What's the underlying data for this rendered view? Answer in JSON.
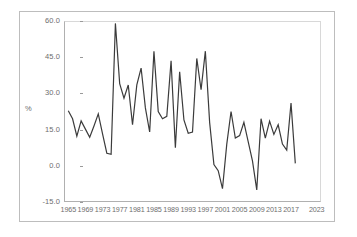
{
  "chart_data": {
    "type": "line",
    "title": "",
    "xlabel": "",
    "ylabel": "%",
    "xlim": [
      1964,
      2024
    ],
    "ylim": [
      -15.0,
      60.0
    ],
    "grid": false,
    "legend": "none",
    "line_color": "#3b3b3b",
    "frame_color": "#bdbdbd",
    "axis_color": "#b0b0b0",
    "tick_text_color": "#6e6e6e",
    "ytick_labels": [
      "60.0",
      "45.0",
      "30.0",
      "15.0",
      "0.0",
      "-15.0"
    ],
    "ytick_values": [
      60.0,
      45.0,
      30.0,
      15.0,
      0.0,
      -15.0
    ],
    "xtick_labels": [
      "1965",
      "1969",
      "1973",
      "1977",
      "1981",
      "1985",
      "1989",
      "1993",
      "1997",
      "2001",
      "2005",
      "2009",
      "2013",
      "2017",
      "2023"
    ],
    "xtick_values": [
      1965,
      1969,
      1973,
      1977,
      1981,
      1985,
      1989,
      1993,
      1997,
      2001,
      2005,
      2009,
      2013,
      2017,
      2023
    ],
    "x": [
      1965,
      1966,
      1967,
      1968,
      1969,
      1970,
      1971,
      1972,
      1973,
      1974,
      1975,
      1976,
      1977,
      1978,
      1979,
      1980,
      1981,
      1982,
      1983,
      1984,
      1985,
      1986,
      1987,
      1988,
      1989,
      1990,
      1991,
      1992,
      1993,
      1994,
      1995,
      1996,
      1997,
      1998,
      1999,
      2000,
      2001,
      2002,
      2003,
      2004,
      2005,
      2006,
      2007,
      2008,
      2009,
      2010,
      2011,
      2012,
      2013,
      2014,
      2015,
      2016,
      2017,
      2018
    ],
    "values": [
      22.8,
      19.5,
      12.3,
      18.6,
      15.2,
      11.8,
      16.5,
      21.5,
      13.2,
      5.2,
      4.8,
      59.0,
      34.0,
      28.0,
      33.5,
      17.0,
      33.5,
      40.5,
      24.0,
      14.0,
      47.5,
      22.5,
      19.5,
      20.5,
      43.5,
      7.5,
      39.0,
      19.0,
      13.5,
      14.0,
      44.5,
      31.5,
      47.5,
      18.0,
      0.5,
      -2.0,
      -9.5,
      9.0,
      22.5,
      11.5,
      12.5,
      18.0,
      10.0,
      2.0,
      -10.0,
      19.5,
      11.5,
      18.5,
      13.0,
      17.0,
      9.0,
      6.5,
      26.0,
      1.0
    ],
    "series": [
      {
        "name": "series-1",
        "values": [
          22.8,
          19.5,
          12.3,
          18.6,
          15.2,
          11.8,
          16.5,
          21.5,
          13.2,
          5.2,
          4.8,
          59.0,
          34.0,
          28.0,
          33.5,
          17.0,
          33.5,
          40.5,
          24.0,
          14.0,
          47.5,
          22.5,
          19.5,
          20.5,
          43.5,
          7.5,
          39.0,
          19.0,
          13.5,
          14.0,
          44.5,
          31.5,
          47.5,
          18.0,
          0.5,
          -2.0,
          -9.5,
          9.0,
          22.5,
          11.5,
          12.5,
          18.0,
          10.0,
          2.0,
          -10.0,
          19.5,
          11.5,
          18.5,
          13.0,
          17.0,
          9.0,
          6.5,
          26.0,
          1.0
        ]
      }
    ]
  }
}
